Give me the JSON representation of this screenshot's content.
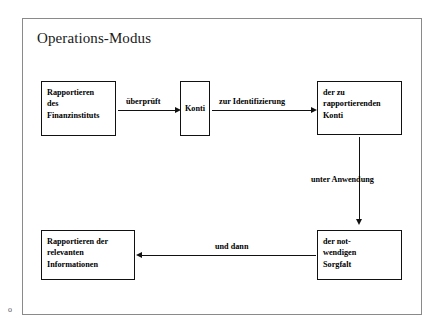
{
  "title": "Operations-Modus",
  "colors": {
    "frame_border": "#8a8a8a",
    "node_border": "#111111",
    "connector": "#111111",
    "text": "#000000",
    "background": "#ffffff"
  },
  "nodes": [
    {
      "id": "reporting-institution",
      "lines": [
        "Rapportieren",
        "des",
        "Finanzinstituts"
      ],
      "align": "left"
    },
    {
      "id": "konti",
      "lines": [
        "Konti"
      ],
      "align": "center"
    },
    {
      "id": "reportable-konti",
      "lines": [
        "der zu",
        "rapportierenden",
        "Konti"
      ],
      "align": "left"
    },
    {
      "id": "due-diligence",
      "lines": [
        "der not-",
        "wendigen",
        "Sorgfalt"
      ],
      "align": "left"
    },
    {
      "id": "report-information",
      "lines": [
        "Rapportieren der",
        "relevanten",
        "Informationen"
      ],
      "align": "left"
    }
  ],
  "edges": [
    {
      "id": "edge1",
      "label": "überprüft",
      "from": "reporting-institution",
      "to": "konti",
      "direction": "right"
    },
    {
      "id": "edge2",
      "label": "zur Identifizierung",
      "from": "konti",
      "to": "reportable-konti",
      "direction": "right"
    },
    {
      "id": "edge3",
      "label": "unter Anwendung",
      "from": "reportable-konti",
      "to": "due-diligence",
      "direction": "down"
    },
    {
      "id": "edge4",
      "label": "und dann",
      "from": "due-diligence",
      "to": "report-information",
      "direction": "left"
    }
  ],
  "artifact": "o"
}
